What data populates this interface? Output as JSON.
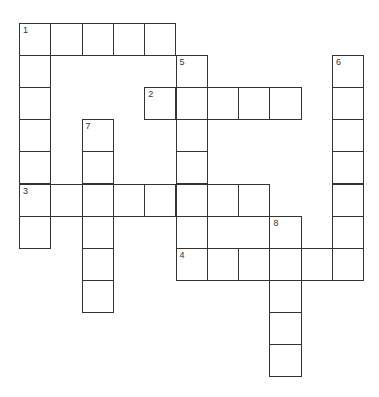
{
  "puzzle": {
    "type": "crossword",
    "words": [
      {
        "number": "1",
        "direction": "down",
        "row": 0,
        "col": 0,
        "length": 7
      },
      {
        "number": "1",
        "direction": "across",
        "row": 0,
        "col": 0,
        "length": 5
      },
      {
        "number": "2",
        "direction": "across",
        "row": 2,
        "col": 4,
        "length": 5
      },
      {
        "number": "3",
        "direction": "across",
        "row": 5,
        "col": 0,
        "length": 8
      },
      {
        "number": "4",
        "direction": "across",
        "row": 7,
        "col": 5,
        "length": 6
      },
      {
        "number": "5",
        "direction": "down",
        "row": 1,
        "col": 5,
        "length": 7
      },
      {
        "number": "6",
        "direction": "down",
        "row": 1,
        "col": 10,
        "length": 7
      },
      {
        "number": "7",
        "direction": "down",
        "row": 3,
        "col": 2,
        "length": 6
      },
      {
        "number": "8",
        "direction": "down",
        "row": 6,
        "col": 8,
        "length": 5
      }
    ],
    "cell_values": {}
  }
}
